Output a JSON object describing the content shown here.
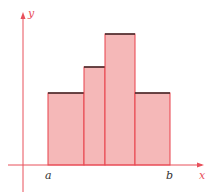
{
  "figure": {
    "axis_labels": {
      "x": "x",
      "y": "y"
    },
    "interval_labels": {
      "start": "a",
      "end": "b"
    },
    "colors": {
      "axis": "#e8505b",
      "bar_fill": "#f5b8b8",
      "bar_edge": "#e8404a",
      "bar_top": "#3a2a2a",
      "label": "#333333"
    }
  },
  "chart_data": {
    "type": "bar",
    "title": "",
    "xlabel": "x",
    "ylabel": "y",
    "categories": [
      "a–x1",
      "x1–x2",
      "x2–x3",
      "x3–b"
    ],
    "bars": [
      {
        "x0": 48,
        "x1": 84,
        "top": 93
      },
      {
        "x0": 84,
        "x1": 105,
        "top": 67
      },
      {
        "x0": 105,
        "x1": 135,
        "top": 34
      },
      {
        "x0": 135,
        "x1": 170,
        "top": 93
      }
    ],
    "values": [
      72,
      98,
      131,
      72
    ],
    "grid": false,
    "legend": "none"
  }
}
